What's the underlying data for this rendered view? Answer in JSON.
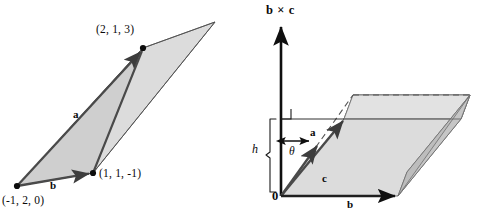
{
  "figure": {
    "background_color": "#ffffff",
    "ink_color": "#111111",
    "fill_light": "#d9d9d9",
    "fill_lighter": "#e6e6e6",
    "fill_mid": "#cccccc",
    "fill_dark": "#bfbfbf"
  },
  "left_diagram": {
    "name": "triangle-parallelogram-with-coordinate-vertices",
    "vertices": [
      {
        "id": "origin-vertex",
        "label": "(-1, 2, 0)",
        "x": 17,
        "y": 186
      },
      {
        "id": "lower-right-vertex",
        "label": "(1, 1, -1)",
        "x": 93,
        "y": 173
      },
      {
        "id": "upper-vertex",
        "label": "(2, 1, 3)",
        "x": 143,
        "y": 48
      },
      {
        "id": "far-vertex",
        "label": "",
        "x": 215,
        "y": 22
      }
    ],
    "vectors": [
      {
        "id": "vector-a",
        "label": "a"
      },
      {
        "id": "vector-b",
        "label": "b"
      }
    ],
    "vector_a_label": "a",
    "vector_b_label": "b",
    "coord_label_top": "(2, 1, 3)",
    "coord_label_right": "(1, 1, -1)",
    "coord_label_bottom_left": "(-1, 2, 0)"
  },
  "right_diagram": {
    "name": "parallelepiped-volume-with-height",
    "axis_label": "b × c",
    "height_label": "h",
    "angle_label": "θ",
    "origin_label": "0",
    "vectors": [
      {
        "id": "vector-a",
        "label": "a"
      },
      {
        "id": "vector-b",
        "label": "b"
      },
      {
        "id": "vector-c",
        "label": "c"
      }
    ],
    "vector_a_label": "a",
    "vector_b_label": "b",
    "vector_c_label": "c",
    "right_angle_marker": "right-angle-square"
  }
}
